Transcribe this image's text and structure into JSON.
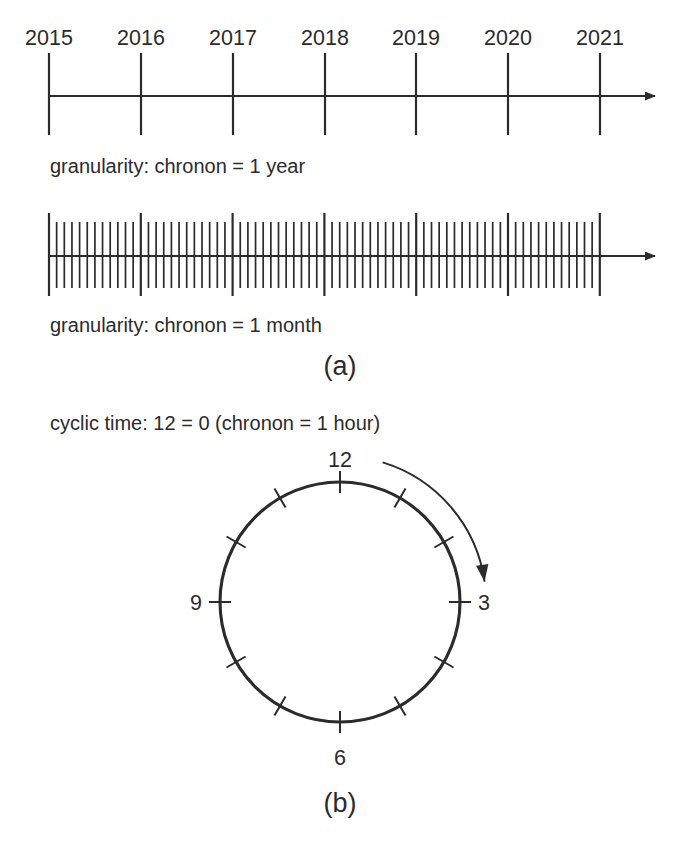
{
  "figure": {
    "title_absent": true,
    "background_color": "#ffffff",
    "ink_color": "#2b2b2b",
    "width": 700,
    "height": 847
  },
  "panel_a": {
    "label": "(a)",
    "timeline_year": {
      "caption": "granularity: chronon = 1 year",
      "tick_labels": [
        "2015",
        "2016",
        "2017",
        "2018",
        "2019",
        "2020",
        "2021"
      ],
      "tick_count": 7,
      "axis_start_x": 49,
      "axis_end_x": 663,
      "axis_y": 96,
      "tick_spacing_px": 91.8,
      "tick_top_y": 53,
      "tick_bottom_y": 135,
      "label_y": 45,
      "arrow": "right-arrowhead"
    },
    "timeline_month": {
      "caption": "granularity: chronon = 1 month",
      "chronon": "1 month",
      "year_boundary_count": 7,
      "months_per_year": 12,
      "month_tick_count": 73,
      "axis_start_x": 49,
      "axis_end_x": 663,
      "axis_y": 256,
      "year_tick_top_y": 213,
      "year_tick_bottom_y": 296,
      "month_tick_top_y": 222,
      "month_tick_bottom_y": 288,
      "month_spacing_px": 7.65,
      "arrow": "right-arrowhead"
    }
  },
  "panel_b": {
    "label": "(b)",
    "caption": "cyclic time: 12 = 0 (chronon = 1 hour)",
    "chronon": "1 hour",
    "cycle_length": 12,
    "clock": {
      "center_x": 340,
      "center_y": 602,
      "radius": 120,
      "tick_count": 12,
      "tick_inner_offset": 11,
      "tick_outer_offset": 11,
      "numbered_ticks": [
        {
          "value": "12",
          "hour": 12,
          "angle_deg": 270,
          "label_x": 340,
          "label_y": 467,
          "anchor": "middle"
        },
        {
          "value": "3",
          "hour": 3,
          "angle_deg": 0,
          "label_x": 478,
          "label_y": 610,
          "anchor": "start"
        },
        {
          "value": "6",
          "hour": 6,
          "angle_deg": 90,
          "label_x": 340,
          "label_y": 765,
          "anchor": "middle"
        },
        {
          "value": "9",
          "hour": 9,
          "angle_deg": 180,
          "label_x": 202,
          "label_y": 610,
          "anchor": "end"
        }
      ],
      "direction_arrow": {
        "semantic": "clockwise-direction-arrow",
        "arc_radius": 146,
        "start_angle_deg": 287,
        "end_angle_deg": 352
      }
    }
  },
  "captions": {
    "year_caption_x": 50,
    "year_caption_y": 173,
    "month_caption_x": 50,
    "month_caption_y": 332,
    "cyclic_caption_x": 50,
    "cyclic_caption_y": 430,
    "panel_a_x": 340,
    "panel_a_y": 375,
    "panel_b_x": 340,
    "panel_b_y": 812
  }
}
